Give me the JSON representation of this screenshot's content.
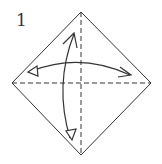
{
  "diagram": {
    "step_number": "1",
    "shape": "square rotated 45 degrees (diamond)",
    "folds": [
      {
        "type": "valley-fold",
        "direction": "horizontal",
        "arrow": "two-way"
      },
      {
        "type": "valley-fold",
        "direction": "vertical",
        "arrow": "two-way"
      }
    ],
    "colors": {
      "line": "#333333",
      "background": "#ffffff"
    }
  }
}
